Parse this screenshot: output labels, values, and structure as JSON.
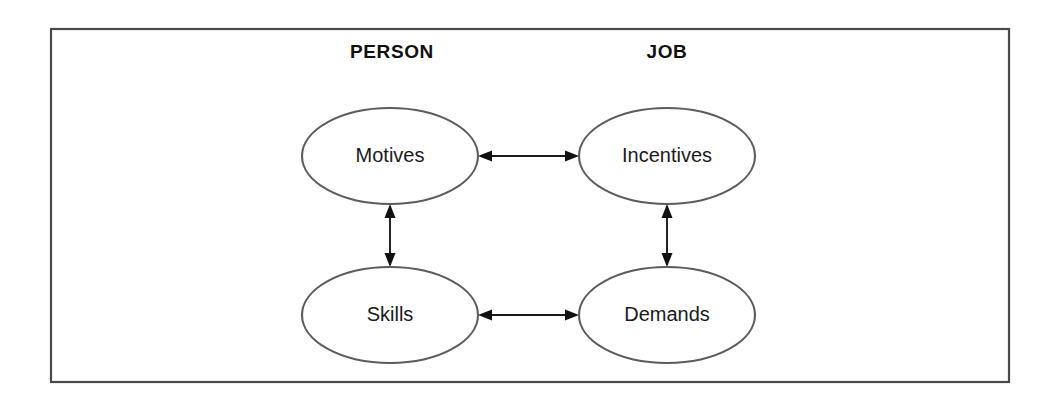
{
  "figure": {
    "type": "relationship-diagram",
    "title_visible": false,
    "frame": {
      "x": 51,
      "y": 29,
      "width": 958,
      "height": 353,
      "border_color": "#4a4a4a",
      "fill_color": "#ffffff"
    },
    "background_color": "#ffffff",
    "headers": [
      {
        "id": "person",
        "label": "PERSON",
        "x": 392,
        "y": 52
      },
      {
        "id": "job",
        "label": "JOB",
        "x": 667,
        "y": 52
      }
    ],
    "nodes": [
      {
        "id": "motives",
        "label": "Motives",
        "column": "PERSON",
        "row": "top",
        "cx": 390,
        "cy": 156,
        "rx": 88,
        "ry": 48
      },
      {
        "id": "incentives",
        "label": "Incentives",
        "column": "JOB",
        "row": "top",
        "cx": 667,
        "cy": 156,
        "rx": 88,
        "ry": 48
      },
      {
        "id": "skills",
        "label": "Skills",
        "column": "PERSON",
        "row": "bottom",
        "cx": 390,
        "cy": 315,
        "rx": 88,
        "ry": 48
      },
      {
        "id": "demands",
        "label": "Demands",
        "column": "JOB",
        "row": "bottom",
        "cx": 667,
        "cy": 315,
        "rx": 88,
        "ry": 48
      }
    ],
    "links": [
      {
        "id": "motives-incentives",
        "from": "motives",
        "to": "incentives",
        "orientation": "horizontal",
        "double_headed": true,
        "x1": 478,
        "y1": 156,
        "x2": 579,
        "y2": 156
      },
      {
        "id": "skills-demands",
        "from": "skills",
        "to": "demands",
        "orientation": "horizontal",
        "double_headed": true,
        "x1": 478,
        "y1": 315,
        "x2": 579,
        "y2": 315
      },
      {
        "id": "motives-skills",
        "from": "motives",
        "to": "skills",
        "orientation": "vertical",
        "double_headed": true,
        "x1": 390,
        "y1": 204,
        "x2": 390,
        "y2": 267
      },
      {
        "id": "incentives-demands",
        "from": "incentives",
        "to": "demands",
        "orientation": "vertical",
        "double_headed": true,
        "x1": 667,
        "y1": 204,
        "x2": 667,
        "y2": 267
      }
    ],
    "colors": {
      "node_stroke": "#5c5c5c",
      "node_fill": "#ffffff",
      "arrow": "#111111",
      "text": "#1a1a1a",
      "frame": "#4a4a4a"
    }
  }
}
